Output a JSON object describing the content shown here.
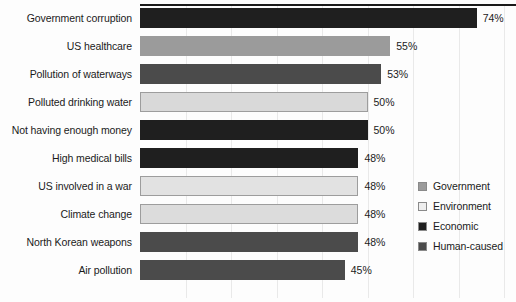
{
  "chart_data": {
    "type": "bar",
    "orientation": "horizontal",
    "title": "",
    "subtitle": "",
    "xlabel": "",
    "ylabel": "",
    "xlim": [
      0,
      80
    ],
    "grid": true,
    "grid_axis": "x",
    "value_suffix": "%",
    "legend_position": "right",
    "categories": [
      "Government corruption",
      "US healthcare",
      "Pollution of waterways",
      "Polluted drinking water",
      "Not having enough money",
      "High medical bills",
      "US involved in a war",
      "Climate change",
      "North Korean weapons",
      "Air pollution"
    ],
    "values": [
      74,
      55,
      53,
      50,
      50,
      48,
      48,
      48,
      48,
      45
    ],
    "value_labels": [
      "74%",
      "55%",
      "53%",
      "50%",
      "50%",
      "48%",
      "48%",
      "48%",
      "48%",
      "45%"
    ],
    "point_groups": [
      "Economic",
      "Government",
      "Human-caused",
      "Environment",
      "Economic",
      "Economic",
      "Government",
      "Environment",
      "Human-caused",
      "Human-caused"
    ],
    "bar_colors": [
      "#1f1f1f",
      "#9b9b9b",
      "#4b4b4b",
      "#d9d9d9",
      "#1f1f1f",
      "#1f1f1f",
      "#e2e2e2",
      "#dcdcdc",
      "#4b4b4b",
      "#4b4b4b"
    ],
    "legend": [
      {
        "label": "Government",
        "color": "#9b9b9b"
      },
      {
        "label": "Environment",
        "color": "#eeeeee"
      },
      {
        "label": "Economic",
        "color": "#1f1f1f"
      },
      {
        "label": "Human-caused",
        "color": "#4b4b4b"
      }
    ],
    "gridline_values": [
      10,
      20,
      30,
      40,
      50,
      60,
      70,
      80
    ]
  }
}
